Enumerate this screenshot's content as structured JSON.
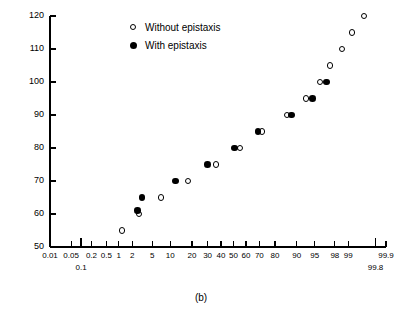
{
  "caption": "(b)",
  "legend": {
    "position": "top-right-inside",
    "items": [
      {
        "label": "Without epistaxis",
        "marker": "open-circle"
      },
      {
        "label": "With epistaxis",
        "marker": "filled-circle"
      }
    ]
  },
  "axes": {
    "ylabel": "Diastolic pressure (mmHg)",
    "xlabel": "",
    "ylim": [
      50,
      120
    ],
    "yticks": [
      50,
      60,
      70,
      80,
      90,
      100,
      110,
      120
    ],
    "ytick_labels": [
      "50",
      "60",
      "70",
      "80",
      "90",
      "100",
      "110",
      "120"
    ],
    "xscale": "normal-probability",
    "xlim": [
      0.01,
      99.9
    ],
    "xticks": [
      0.01,
      0.05,
      0.1,
      0.2,
      0.5,
      1,
      2,
      5,
      10,
      20,
      30,
      40,
      50,
      60,
      70,
      80,
      90,
      95,
      98,
      99,
      99.8,
      99.9
    ],
    "xtick_labels": [
      "0.01",
      "0.05",
      "0.1",
      "0.2",
      "0.5",
      "1",
      "2",
      "5",
      "10",
      "20",
      "30",
      "40",
      "50",
      "60",
      "70",
      "80",
      "90",
      "95",
      "98",
      "99",
      "99.8",
      "99.9"
    ],
    "xtick_offset_rows": {
      "0.1": "second-row",
      "99.8": "second-row"
    },
    "grid": false
  },
  "chart_data": {
    "type": "scatter",
    "title": "",
    "xlabel": "Cumulative percent (normal probability scale)",
    "ylabel": "Diastolic pressure (mmHg)",
    "xlim": [
      0.01,
      99.9
    ],
    "ylim": [
      50,
      120
    ],
    "grid": false,
    "legend_position": "upper-left-inside",
    "series": [
      {
        "name": "Without epistaxis",
        "marker": "open-circle",
        "points": [
          {
            "x": 1.2,
            "y": 55
          },
          {
            "x": 2.8,
            "y": 60
          },
          {
            "x": 7.0,
            "y": 65
          },
          {
            "x": 18.0,
            "y": 70
          },
          {
            "x": 36.0,
            "y": 75
          },
          {
            "x": 55.0,
            "y": 80
          },
          {
            "x": 72.0,
            "y": 85
          },
          {
            "x": 86.0,
            "y": 90
          },
          {
            "x": 93.0,
            "y": 95
          },
          {
            "x": 96.0,
            "y": 100
          },
          {
            "x": 97.5,
            "y": 105
          },
          {
            "x": 98.6,
            "y": 110
          },
          {
            "x": 99.2,
            "y": 115
          },
          {
            "x": 99.6,
            "y": 120
          }
        ]
      },
      {
        "name": "With epistaxis",
        "marker": "filled-circle",
        "points": [
          {
            "x": 2.6,
            "y": 61
          },
          {
            "x": 3.2,
            "y": 65
          },
          {
            "x": 12.0,
            "y": 70
          },
          {
            "x": 30.0,
            "y": 75
          },
          {
            "x": 51.0,
            "y": 80
          },
          {
            "x": 69.0,
            "y": 85
          },
          {
            "x": 88.0,
            "y": 90
          },
          {
            "x": 94.5,
            "y": 95
          },
          {
            "x": 97.0,
            "y": 100
          }
        ]
      }
    ]
  },
  "geometry": {
    "plot_left": 50,
    "plot_right": 386,
    "plot_top": 16,
    "plot_bottom": 247
  }
}
